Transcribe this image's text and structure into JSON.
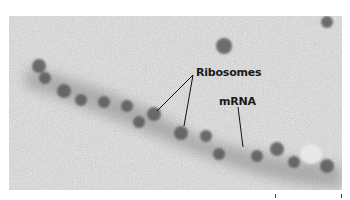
{
  "figure": {
    "type": "electron micrograph",
    "labels": {
      "ribosomes": "Ribosomes",
      "mrna": "mRNA"
    },
    "colors": {
      "background": "#cfcfcf",
      "particles": "#555555",
      "label_text": "#1a1a1a"
    },
    "scale_bar": true
  }
}
